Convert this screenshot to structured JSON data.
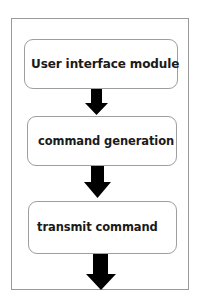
{
  "diagram": {
    "type": "flowchart",
    "direction": "top-to-bottom",
    "colors": {
      "frame_border": "#9a9a9a",
      "node_border": "#9e9e9e",
      "arrow": "#000000",
      "text": "#1a1a1a",
      "background": "#ffffff"
    },
    "nodes": [
      {
        "id": "n1",
        "label": "User interface module"
      },
      {
        "id": "n2",
        "label": "command generation"
      },
      {
        "id": "n3",
        "label": "transmit command"
      }
    ],
    "edges": [
      {
        "from": "n1",
        "to": "n2",
        "style": "block-arrow-down"
      },
      {
        "from": "n2",
        "to": "n3",
        "style": "block-arrow-down"
      },
      {
        "from": "n3",
        "to": null,
        "style": "block-arrow-down"
      }
    ]
  }
}
